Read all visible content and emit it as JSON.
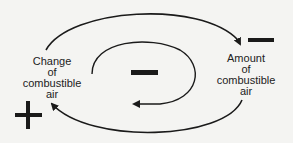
{
  "diagram": {
    "type": "causal-loop",
    "nodes": [
      {
        "id": "change",
        "lines": [
          "Change",
          "of",
          "combustible",
          "air"
        ]
      },
      {
        "id": "amount",
        "lines": [
          "Amount",
          "of",
          "combustible",
          "air"
        ]
      }
    ],
    "signs": {
      "outer_top_right": "−",
      "inner_loop": "−",
      "outer_bottom_left": "+"
    },
    "edges": [
      {
        "from": "change",
        "to": "amount",
        "path": "outer-top-arc"
      },
      {
        "from": "amount",
        "to": "change",
        "path": "outer-bottom-arc"
      },
      {
        "from": "change",
        "to": "amount",
        "path": "inner-loop-counterclockwise"
      }
    ],
    "colors": {
      "line": "#1a1a1a",
      "background": "#f4f4f2"
    }
  }
}
